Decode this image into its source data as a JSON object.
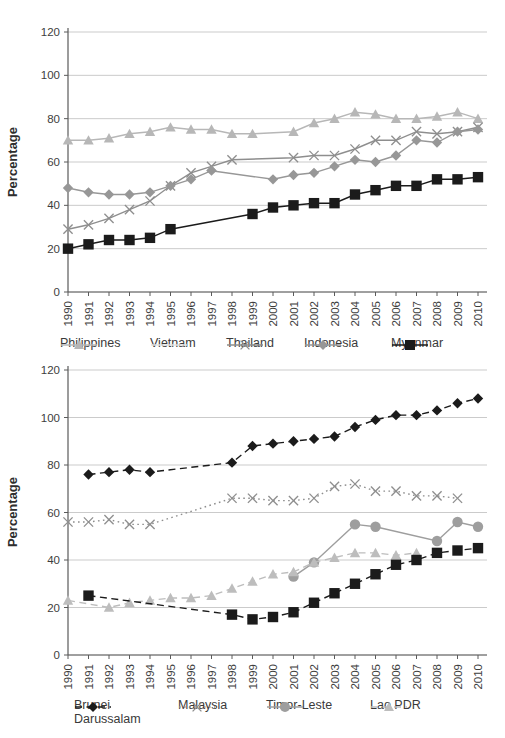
{
  "figure": {
    "background": "#ffffff"
  },
  "chart_data": [
    {
      "id": "top-chart",
      "type": "line",
      "title": "",
      "xlabel": "",
      "ylabel": "Percentage",
      "ylim": [
        0,
        120
      ],
      "y_ticks": [
        0,
        20,
        40,
        60,
        80,
        100,
        120
      ],
      "grid": true,
      "legend_position": "bottom",
      "categories": [
        "1990",
        "1991",
        "1992",
        "1993",
        "1994",
        "1995",
        "1996",
        "1997",
        "1998",
        "1999",
        "2000",
        "2001",
        "2002",
        "2003",
        "2004",
        "2005",
        "2006",
        "2007",
        "2008",
        "2009",
        "2010"
      ],
      "series": [
        {
          "name": "Philippines",
          "marker": "triangle",
          "line": "solid",
          "color": "#b7b7b7",
          "values": [
            70,
            70,
            71,
            73,
            74,
            76,
            75,
            75,
            73,
            73,
            null,
            74,
            78,
            80,
            83,
            82,
            80,
            80,
            81,
            83,
            80
          ],
          "in_legend": true
        },
        {
          "name": "Vietnam",
          "marker": "none",
          "line": "solid",
          "color": "#e2e2e2",
          "values": [
            null,
            null,
            null,
            null,
            null,
            null,
            null,
            null,
            null,
            null,
            null,
            null,
            null,
            null,
            null,
            null,
            null,
            null,
            null,
            null,
            null
          ],
          "in_legend": true
        },
        {
          "name": "Thailand",
          "marker": "xmark",
          "line": "solid",
          "color": "#8e8e8e",
          "values": [
            29,
            31,
            34,
            38,
            42,
            49,
            55,
            58,
            61,
            null,
            null,
            62,
            63,
            63,
            66,
            70,
            70,
            74,
            73,
            74,
            76
          ],
          "in_legend": true
        },
        {
          "name": "Indonesia",
          "marker": "diamond",
          "line": "solid",
          "color": "#979797",
          "values": [
            48,
            46,
            45,
            45,
            46,
            49,
            52,
            56,
            null,
            null,
            52,
            54,
            55,
            58,
            61,
            60,
            63,
            70,
            69,
            74,
            75
          ],
          "in_legend": true
        },
        {
          "name": "Myanmar",
          "marker": "square",
          "line": "solid",
          "color": "#1b1b1b",
          "values": [
            20,
            22,
            24,
            24,
            25,
            29,
            null,
            null,
            null,
            36,
            39,
            40,
            41,
            41,
            45,
            47,
            49,
            49,
            52,
            52,
            53
          ],
          "in_legend": true
        }
      ]
    },
    {
      "id": "bottom-chart",
      "type": "line",
      "title": "",
      "xlabel": "",
      "ylabel": "Percentage",
      "ylim": [
        0,
        120
      ],
      "y_ticks": [
        0,
        20,
        40,
        60,
        80,
        100,
        120
      ],
      "grid": true,
      "legend_position": "bottom",
      "categories": [
        "1990",
        "1991",
        "1992",
        "1993",
        "1994",
        "1995",
        "1996",
        "1997",
        "1998",
        "1999",
        "2000",
        "2001",
        "2002",
        "2003",
        "2004",
        "2005",
        "2006",
        "2007",
        "2008",
        "2009",
        "2010"
      ],
      "series": [
        {
          "name": "Brunei Darussalam",
          "marker": "diamond",
          "line": "dashed",
          "color": "#1b1b1b",
          "values": [
            null,
            76,
            77,
            78,
            77,
            null,
            null,
            null,
            81,
            88,
            89,
            90,
            91,
            92,
            96,
            99,
            101,
            101,
            103,
            106,
            108
          ],
          "in_legend": true
        },
        {
          "name": "Malaysia",
          "marker": "xmark",
          "line": "dotted",
          "color": "#8e8e8e",
          "values": [
            56,
            56,
            57,
            55,
            55,
            null,
            null,
            null,
            66,
            66,
            65,
            65,
            66,
            71,
            72,
            69,
            69,
            67,
            67,
            66,
            null
          ],
          "in_legend": true
        },
        {
          "name": "Timor-Leste",
          "marker": "circle",
          "line": "solid",
          "color": "#9e9e9e",
          "values": [
            null,
            null,
            null,
            null,
            null,
            null,
            null,
            null,
            null,
            null,
            null,
            33,
            39,
            null,
            55,
            54,
            null,
            null,
            48,
            56,
            54
          ],
          "in_legend": true
        },
        {
          "name": "Lao PDR",
          "marker": "triangle",
          "line": "dashed",
          "color": "#bdbdbd",
          "values": [
            23,
            null,
            20,
            22,
            23,
            24,
            24,
            25,
            28,
            31,
            34,
            35,
            39,
            41,
            43,
            43,
            42,
            43,
            null,
            null,
            null
          ],
          "in_legend": true
        },
        {
          "name": "(unlabeled series, black squares)",
          "marker": "square",
          "line": "dashed",
          "color": "#1b1b1b",
          "values": [
            null,
            25,
            null,
            null,
            null,
            null,
            null,
            null,
            17,
            15,
            16,
            18,
            22,
            26,
            30,
            34,
            38,
            40,
            43,
            44,
            45
          ],
          "in_legend": false
        }
      ]
    }
  ]
}
